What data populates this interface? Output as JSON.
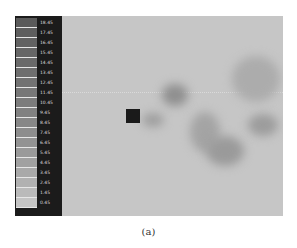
{
  "colorbar": {
    "labels": [
      "18.45",
      "17.45",
      "16.45",
      "15.45",
      "14.45",
      "13.45",
      "12.45",
      "11.45",
      "10.45",
      "9.45",
      "8.45",
      "7.45",
      "6.45",
      "5.45",
      "4.45",
      "3.45",
      "2.45",
      "1.45",
      "0.45"
    ],
    "swatch_colors": [
      "#5a5a5a",
      "#5e5e5e",
      "#626262",
      "#666666",
      "#6a6a6a",
      "#6e6e6e",
      "#727272",
      "#777777",
      "#7c7c7c",
      "#818181",
      "#878787",
      "#8d8d8d",
      "#939393",
      "#9a9a9a",
      "#a1a1a1",
      "#a9a9a9",
      "#b1b1b1",
      "#bababa",
      "#c4c4c4"
    ]
  },
  "field": {
    "background": "#c6c6c6",
    "obstacle": "square",
    "obstacle_color": "#1a1a1a"
  },
  "caption": "(a)"
}
